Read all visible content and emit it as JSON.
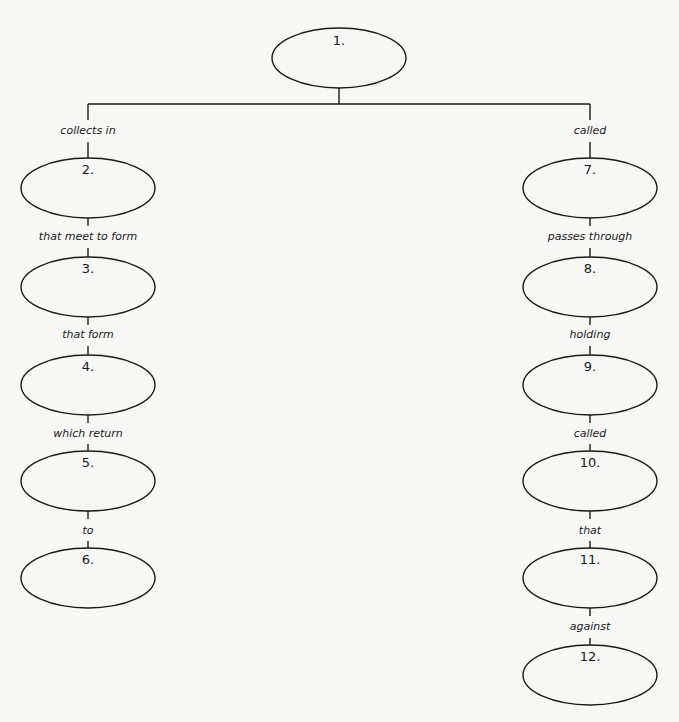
{
  "diagram": {
    "type": "concept-map",
    "root": {
      "id": "1",
      "label": "1."
    },
    "left_branch": {
      "root_link": "collects in",
      "nodes": [
        {
          "id": "2",
          "label": "2."
        },
        {
          "id": "3",
          "label": "3."
        },
        {
          "id": "4",
          "label": "4."
        },
        {
          "id": "5",
          "label": "5."
        },
        {
          "id": "6",
          "label": "6."
        }
      ],
      "links": [
        "that meet to form",
        "that form",
        "which return",
        "to"
      ]
    },
    "right_branch": {
      "root_link": "called",
      "nodes": [
        {
          "id": "7",
          "label": "7."
        },
        {
          "id": "8",
          "label": "8."
        },
        {
          "id": "9",
          "label": "9."
        },
        {
          "id": "10",
          "label": "10."
        },
        {
          "id": "11",
          "label": "11."
        },
        {
          "id": "12",
          "label": "12."
        }
      ],
      "links": [
        "passes through",
        "holding",
        "called",
        "that",
        "against"
      ]
    }
  }
}
